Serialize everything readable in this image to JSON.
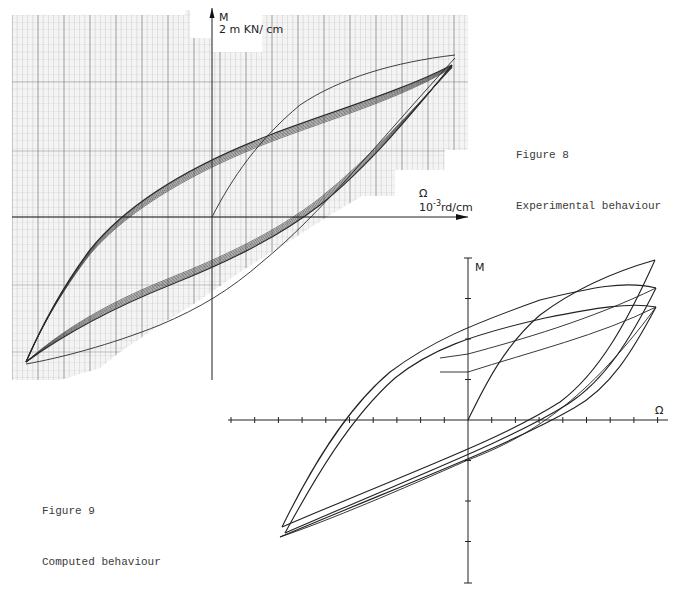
{
  "figure8": {
    "caption_number": "Figure 8",
    "caption_text": "Experimental behaviour",
    "axis_m_label": "M",
    "axis_m_unit": "2 m KN/ cm",
    "axis_omega_label": "Ω",
    "axis_omega_unit_base": "10",
    "axis_omega_unit_exp": "-3",
    "axis_omega_unit_rest": "rd/cm",
    "grid_color": "#9a9a9a",
    "curve_color": "#2a2a2a"
  },
  "figure9": {
    "caption_number": "Figure 9",
    "caption_text": "Computed behaviour",
    "axis_m_label": "M",
    "axis_omega_label": "Ω",
    "curve_color": "#222222"
  },
  "chart_data": [
    {
      "type": "line",
      "title": "Figure 8 — Experimental behaviour",
      "xlabel": "Ω (10^-3 rd/cm)",
      "ylabel": "M (2 m KN/cm)",
      "grid": true,
      "description": "Moment–curvature hysteresis loops on graph paper; multiple nearly coincident cycles plus initial loading branch from origin",
      "series": [
        {
          "name": "initial loading",
          "x": [
            0,
            1.2,
            2.6,
            4.2,
            5.6
          ],
          "y": [
            0,
            1.5,
            2.8,
            3.7,
            4.4
          ]
        },
        {
          "name": "unloading branch (upper)",
          "x": [
            5.3,
            3,
            0,
            -3,
            -6,
            -8.8
          ],
          "y": [
            4.0,
            3.0,
            1.5,
            -0.5,
            -2.8,
            -5.1
          ]
        },
        {
          "name": "reloading branch (lower)",
          "x": [
            -8.8,
            -6,
            -3,
            0,
            3,
            5.3
          ],
          "y": [
            -5.1,
            -3.8,
            -2.5,
            -1.0,
            1.0,
            4.0
          ]
        }
      ]
    },
    {
      "type": "line",
      "title": "Figure 9 — Computed behaviour",
      "xlabel": "Ω",
      "ylabel": "M",
      "grid": false,
      "x_ticks": 17,
      "y_ticks": 13,
      "description": "Three computed hysteresis loops with increasing amplitude plus initial loading branch from origin",
      "series": [
        {
          "name": "initial loading",
          "x": [
            0,
            1,
            2,
            3,
            4,
            5.6
          ],
          "y": [
            0,
            1.6,
            3.0,
            4.0,
            4.7,
            5.0
          ]
        },
        {
          "name": "loop 1 tip",
          "x": [
            7.8
          ],
          "y": [
            4.6
          ]
        },
        {
          "name": "loop 2 tip",
          "x": [
            7.8
          ],
          "y": [
            3.9
          ]
        },
        {
          "name": "loop 3 tip",
          "x": [
            7.8
          ],
          "y": [
            3.4
          ]
        },
        {
          "name": "lower tips",
          "x": [
            -7.7,
            -7.6,
            -7.8
          ],
          "y": [
            -2.9,
            -3.1,
            -3.2
          ]
        }
      ]
    }
  ]
}
